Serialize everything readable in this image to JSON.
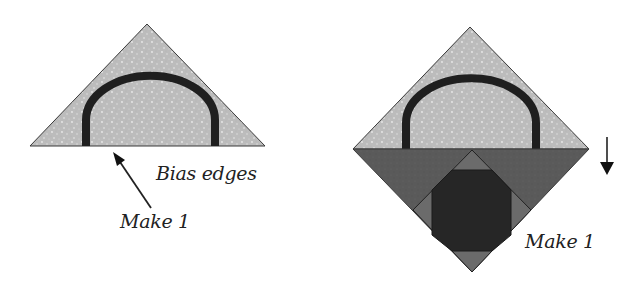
{
  "left_figure": {
    "labels": {
      "bias_edges": "Bias edges",
      "make": "Make 1"
    }
  },
  "right_figure": {
    "labels": {
      "make": "Make 1"
    }
  },
  "colors": {
    "light_fabric": "#bdbdbd",
    "arch": "#1f1f1f",
    "medium_dark_fabric": "#5a5a5a",
    "dark_center": "#262626",
    "inner_triangle": "#6e6e6e",
    "outline": "#3a3a3a",
    "text": "#222222"
  }
}
